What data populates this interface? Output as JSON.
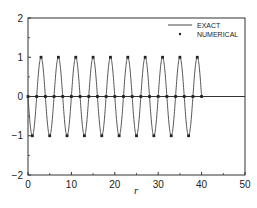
{
  "chart_data": {
    "type": "line",
    "title": "",
    "xlabel": "r",
    "ylabel": "",
    "xlim": [
      0,
      50
    ],
    "ylim": [
      -2,
      2
    ],
    "xticks": [
      0,
      10,
      20,
      30,
      40,
      50
    ],
    "yticks": [
      -2,
      -1,
      0,
      1,
      2
    ],
    "xtick_labels": [
      "0",
      "10",
      "20",
      "30",
      "40",
      "50"
    ],
    "ytick_labels": [
      "−2",
      "−1",
      "0",
      "1",
      "2"
    ],
    "grid": false,
    "legend_position": "upper right",
    "zero_line": true,
    "series": [
      {
        "name": "EXACT",
        "style": "line",
        "function": "-sin(pi*r/2)",
        "x_range": [
          0,
          40
        ]
      },
      {
        "name": "NUMERICAL",
        "style": "markers",
        "x": [
          0,
          1,
          2,
          3,
          4,
          5,
          6,
          7,
          8,
          9,
          10,
          11,
          12,
          13,
          14,
          15,
          16,
          17,
          18,
          19,
          20,
          21,
          22,
          23,
          24,
          25,
          26,
          27,
          28,
          29,
          30,
          31,
          32,
          33,
          34,
          35,
          36,
          37,
          38,
          39,
          40
        ],
        "y": [
          0,
          -1,
          0,
          1,
          0,
          -1,
          0,
          1,
          0,
          -1,
          0,
          1,
          0,
          -1,
          0,
          1,
          0,
          -1,
          0,
          1,
          0,
          -1,
          0,
          1,
          0,
          -1,
          0,
          1,
          0,
          -1,
          0,
          1,
          0,
          -1,
          0,
          1,
          0,
          -1,
          0,
          1,
          0
        ]
      }
    ]
  },
  "legend": {
    "items": [
      {
        "label": "EXACT",
        "symbol": "line"
      },
      {
        "label": "NUMERICAL",
        "symbol": "marker"
      }
    ]
  },
  "colors": {
    "line": "#444444",
    "marker": "#222222",
    "axis": "#333333"
  }
}
